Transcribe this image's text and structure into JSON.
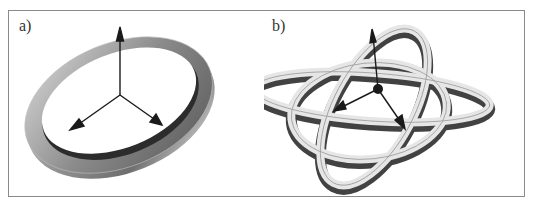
{
  "figure": {
    "panels": [
      {
        "id": "a",
        "label": "a)",
        "description": "Elliptical ring (torus-like band) with three coordinate axis arrows from its center"
      },
      {
        "id": "b",
        "label": "b)",
        "description": "Knotted ring with looped lobes and three coordinate axis arrows from the center"
      }
    ]
  },
  "colors": {
    "frame_border": "#8a8a8a",
    "ring_dark": "#3a3a3a",
    "ring_mid": "#8c8c8c",
    "ring_light": "#e8e8e8",
    "axis_arrow": "#1a1a1a"
  }
}
